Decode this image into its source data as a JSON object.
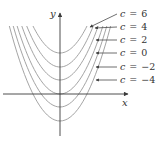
{
  "figure": {
    "axes": {
      "x_label": "x",
      "y_label": "y",
      "origin_px": [
        60,
        94
      ]
    },
    "curve_color": "#9a9a9a",
    "axis_color": "#3a3a3a",
    "curves": [
      {
        "c": 6,
        "label": "c = 6",
        "vertex_y_px": 53
      },
      {
        "c": 4,
        "label": "c = 4",
        "vertex_y_px": 67
      },
      {
        "c": 2,
        "label": "c = 2",
        "vertex_y_px": 80
      },
      {
        "c": 0,
        "label": "c = 0",
        "vertex_y_px": 94
      },
      {
        "c": -2,
        "label": "c = −2",
        "vertex_y_px": 107
      },
      {
        "c": -4,
        "label": "c = −4",
        "vertex_y_px": 121
      }
    ],
    "labels": [
      {
        "var": "c",
        "eq": "=",
        "val": "6",
        "y_px": 17,
        "arrow_from": [
          117,
          14
        ],
        "arrow_to": [
          90,
          27
        ]
      },
      {
        "var": "c",
        "eq": "=",
        "val": "4",
        "y_px": 30,
        "arrow_from": [
          117,
          27
        ],
        "arrow_to": [
          95,
          28
        ]
      },
      {
        "var": "c",
        "eq": "=",
        "val": "2",
        "y_px": 43,
        "arrow_from": [
          117,
          40
        ],
        "arrow_to": [
          96,
          40
        ]
      },
      {
        "var": "c",
        "eq": "=",
        "val": "0",
        "y_px": 56,
        "arrow_from": [
          117,
          53
        ],
        "arrow_to": [
          96,
          53
        ]
      },
      {
        "var": "c",
        "eq": "=",
        "val": "−2",
        "y_px": 70,
        "arrow_from": [
          117,
          67
        ],
        "arrow_to": [
          96,
          67
        ]
      },
      {
        "var": "c",
        "eq": "=",
        "val": "−4",
        "y_px": 83,
        "arrow_from": [
          117,
          80
        ],
        "arrow_to": [
          96,
          80
        ]
      }
    ]
  }
}
